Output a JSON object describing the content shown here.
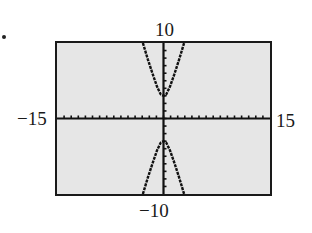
{
  "bullet": "•",
  "window": {
    "xmin_label": "−15",
    "xmax_label": "15",
    "ymin_label": "−10",
    "ymax_label": "10",
    "background": "#e6e6e6",
    "frame_color": "#1a1a1a",
    "curve_color": "#111111"
  },
  "chart_data": {
    "type": "line",
    "title": "",
    "xlabel": "",
    "ylabel": "",
    "xlim": [
      -15,
      15
    ],
    "ylim": [
      -10,
      10
    ],
    "xscale_tick": 1,
    "yscale_tick": 1,
    "grid": false,
    "legend": null,
    "tick_labels": {
      "x": [
        "−15",
        "15"
      ],
      "y": [
        "−10",
        "10"
      ]
    },
    "series": [
      {
        "name": "upper branch",
        "x": [
          -2.9,
          -2.2,
          -1.5,
          -0.9,
          -0.4,
          0,
          0.4,
          0.9,
          1.5,
          2.2,
          2.9
        ],
        "y": [
          10,
          7.8,
          5.8,
          4.2,
          3.2,
          3,
          3.2,
          4.2,
          5.8,
          7.8,
          10
        ]
      },
      {
        "name": "lower branch",
        "x": [
          -2.9,
          -2.2,
          -1.5,
          -0.9,
          -0.4,
          0,
          0.4,
          0.9,
          1.5,
          2.2,
          2.9
        ],
        "y": [
          -10,
          -7.8,
          -5.8,
          -4.2,
          -3.2,
          -3,
          -3.2,
          -4.2,
          -5.8,
          -7.8,
          -10
        ]
      }
    ]
  }
}
